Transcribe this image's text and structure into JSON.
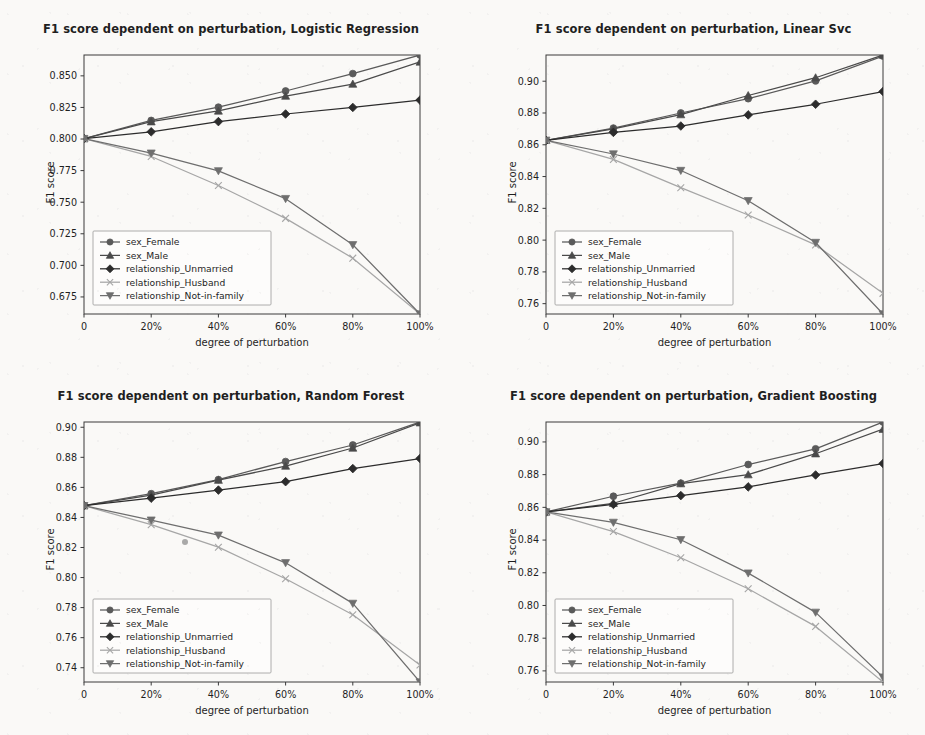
{
  "figure": {
    "background_color": "#faf9f7",
    "ink_color": "#3a3a3a",
    "width": 925,
    "height": 735,
    "panel_count": 4
  },
  "common": {
    "xlabel": "degree of perturbation",
    "ylabel": "F1 score",
    "x_categories": [
      "0",
      "20%",
      "40%",
      "60%",
      "80%",
      "100%"
    ],
    "x_values": [
      0,
      20,
      40,
      60,
      80,
      100
    ],
    "legend_position": "lower left",
    "series_names": [
      "sex_Female",
      "sex_Male",
      "relationship_Unmarried",
      "relationship_Husband",
      "relationship_Not-in-family"
    ],
    "series_markers": [
      "circle",
      "triangle-up",
      "diamond",
      "x",
      "triangle-down"
    ],
    "series_colors": [
      "#5a5a5a",
      "#4a4a4a",
      "#2c2c2c",
      "#a6a6a6",
      "#6e6e6e"
    ]
  },
  "chart_data": [
    {
      "type": "line",
      "panel": "top-left",
      "title": "F1 score dependent on perturbation, Logistic Regression",
      "xlabel": "degree of perturbation",
      "ylabel": "F1 score",
      "categories": [
        "0",
        "20%",
        "40%",
        "60%",
        "80%",
        "100%"
      ],
      "x": [
        0,
        20,
        40,
        60,
        80,
        100
      ],
      "ylim": [
        0.6615,
        0.8665
      ],
      "yticks": [
        0.675,
        0.7,
        0.725,
        0.75,
        0.775,
        0.8,
        0.825,
        0.85
      ],
      "ytick_labels": [
        "0.675",
        "0.700",
        "0.725",
        "0.750",
        "0.775",
        "0.800",
        "0.825",
        "0.850"
      ],
      "grid": false,
      "legend": [
        "sex_Female",
        "sex_Male",
        "relationship_Unmarried",
        "relationship_Husband",
        "relationship_Not-in-family"
      ],
      "series": [
        {
          "name": "sex_Female",
          "marker": "circle",
          "color": "#5a5a5a",
          "values": [
            0.8003,
            0.8147,
            0.8252,
            0.838,
            0.8518,
            0.8665
          ]
        },
        {
          "name": "sex_Male",
          "marker": "triangle-up",
          "color": "#4a4a4a",
          "values": [
            0.8003,
            0.8137,
            0.8222,
            0.834,
            0.8435,
            0.861
          ]
        },
        {
          "name": "relationship_Unmarried",
          "marker": "diamond",
          "color": "#2c2c2c",
          "values": [
            0.8003,
            0.8057,
            0.8138,
            0.8198,
            0.825,
            0.8308
          ]
        },
        {
          "name": "relationship_Husband",
          "marker": "x",
          "color": "#a6a6a6",
          "values": [
            0.8003,
            0.7862,
            0.7632,
            0.7372,
            0.7057,
            0.6615
          ]
        },
        {
          "name": "relationship_Not-in-family",
          "marker": "triangle-down",
          "color": "#6e6e6e",
          "values": [
            0.8003,
            0.7888,
            0.7748,
            0.7528,
            0.7163,
            0.6615
          ]
        }
      ]
    },
    {
      "type": "line",
      "panel": "top-right",
      "title": "F1 score dependent on perturbation, Linear Svc",
      "xlabel": "degree of perturbation",
      "ylabel": "F1 score",
      "categories": [
        "0",
        "20%",
        "40%",
        "60%",
        "80%",
        "100%"
      ],
      "x": [
        0,
        20,
        40,
        60,
        80,
        100
      ],
      "ylim": [
        0.7535,
        0.9165
      ],
      "yticks": [
        0.76,
        0.78,
        0.8,
        0.82,
        0.84,
        0.86,
        0.88,
        0.9
      ],
      "ytick_labels": [
        "0.76",
        "0.78",
        "0.80",
        "0.82",
        "0.84",
        "0.86",
        "0.88",
        "0.90"
      ],
      "grid": false,
      "legend": [
        "sex_Female",
        "sex_Male",
        "relationship_Unmarried",
        "relationship_Husband",
        "relationship_Not-in-family"
      ],
      "series": [
        {
          "name": "sex_Female",
          "marker": "circle",
          "color": "#5a5a5a",
          "values": [
            0.8628,
            0.8705,
            0.88,
            0.889,
            0.9002,
            0.9158
          ]
        },
        {
          "name": "sex_Male",
          "marker": "triangle-up",
          "color": "#4a4a4a",
          "values": [
            0.8628,
            0.87,
            0.879,
            0.891,
            0.9022,
            0.9165
          ]
        },
        {
          "name": "relationship_Unmarried",
          "marker": "diamond",
          "color": "#2c2c2c",
          "values": [
            0.8628,
            0.8678,
            0.8718,
            0.8788,
            0.8855,
            0.8935
          ]
        },
        {
          "name": "relationship_Husband",
          "marker": "x",
          "color": "#a6a6a6",
          "values": [
            0.8628,
            0.8508,
            0.833,
            0.8158,
            0.797,
            0.7665
          ]
        },
        {
          "name": "relationship_Not-in-family",
          "marker": "triangle-down",
          "color": "#6e6e6e",
          "values": [
            0.8628,
            0.8542,
            0.8438,
            0.8248,
            0.7985,
            0.7535
          ]
        }
      ]
    },
    {
      "type": "line",
      "panel": "bottom-left",
      "title": "F1 score dependent on perturbation, Random Forest",
      "xlabel": "degree of perturbation",
      "ylabel": "F1 score",
      "categories": [
        "0",
        "20%",
        "40%",
        "60%",
        "80%",
        "100%"
      ],
      "x": [
        0,
        20,
        40,
        60,
        80,
        100
      ],
      "ylim": [
        0.7305,
        0.9035
      ],
      "yticks": [
        0.74,
        0.76,
        0.78,
        0.8,
        0.82,
        0.84,
        0.86,
        0.88,
        0.9
      ],
      "ytick_labels": [
        "0.74",
        "0.76",
        "0.78",
        "0.80",
        "0.82",
        "0.84",
        "0.86",
        "0.88",
        "0.90"
      ],
      "grid": false,
      "legend": [
        "sex_Female",
        "sex_Male",
        "relationship_Unmarried",
        "relationship_Husband",
        "relationship_Not-in-family"
      ],
      "series": [
        {
          "name": "sex_Female",
          "marker": "circle",
          "color": "#5a5a5a",
          "values": [
            0.8478,
            0.8558,
            0.8652,
            0.8772,
            0.8882,
            0.9035
          ]
        },
        {
          "name": "sex_Male",
          "marker": "triangle-up",
          "color": "#4a4a4a",
          "values": [
            0.8478,
            0.8548,
            0.8648,
            0.8742,
            0.8862,
            0.903
          ]
        },
        {
          "name": "relationship_Unmarried",
          "marker": "diamond",
          "color": "#2c2c2c",
          "values": [
            0.8478,
            0.8528,
            0.8582,
            0.8638,
            0.8725,
            0.8792
          ]
        },
        {
          "name": "relationship_Husband",
          "marker": "x",
          "color": "#a6a6a6",
          "values": [
            0.8478,
            0.8352,
            0.8202,
            0.7992,
            0.7752,
            0.7418
          ]
        },
        {
          "name": "relationship_Not-in-family",
          "marker": "triangle-down",
          "color": "#6e6e6e",
          "values": [
            0.8478,
            0.8382,
            0.8282,
            0.8098,
            0.7828,
            0.7305
          ]
        }
      ]
    },
    {
      "type": "line",
      "panel": "bottom-right",
      "title": "F1 score dependent on perturbation, Gradient Boosting",
      "xlabel": "degree of perturbation",
      "ylabel": "F1 score",
      "categories": [
        "0",
        "20%",
        "40%",
        "60%",
        "80%",
        "100%"
      ],
      "x": [
        0,
        20,
        40,
        60,
        80,
        100
      ],
      "ylim": [
        0.7532,
        0.9122
      ],
      "yticks": [
        0.76,
        0.78,
        0.8,
        0.82,
        0.84,
        0.86,
        0.88,
        0.9
      ],
      "ytick_labels": [
        "0.76",
        "0.78",
        "0.80",
        "0.82",
        "0.84",
        "0.86",
        "0.88",
        "0.90"
      ],
      "grid": false,
      "legend": [
        "sex_Female",
        "sex_Male",
        "relationship_Unmarried",
        "relationship_Husband",
        "relationship_Not-in-family"
      ],
      "series": [
        {
          "name": "sex_Female",
          "marker": "circle",
          "color": "#5a5a5a",
          "values": [
            0.8572,
            0.8668,
            0.8748,
            0.8862,
            0.8958,
            0.9122
          ]
        },
        {
          "name": "sex_Male",
          "marker": "triangle-up",
          "color": "#4a4a4a",
          "values": [
            0.8572,
            0.8625,
            0.8745,
            0.88,
            0.8928,
            0.9078
          ]
        },
        {
          "name": "relationship_Unmarried",
          "marker": "diamond",
          "color": "#2c2c2c",
          "values": [
            0.8572,
            0.8618,
            0.8672,
            0.8725,
            0.8798,
            0.8868
          ]
        },
        {
          "name": "relationship_Husband",
          "marker": "x",
          "color": "#a6a6a6",
          "values": [
            0.8572,
            0.8452,
            0.8292,
            0.8102,
            0.7872,
            0.7532
          ]
        },
        {
          "name": "relationship_Not-in-family",
          "marker": "triangle-down",
          "color": "#6e6e6e",
          "values": [
            0.8572,
            0.8508,
            0.8402,
            0.8198,
            0.7958,
            0.7562
          ]
        }
      ]
    }
  ],
  "artifacts": [
    {
      "name": "scan-speck",
      "x": 182,
      "y": 539,
      "size": 6
    }
  ]
}
